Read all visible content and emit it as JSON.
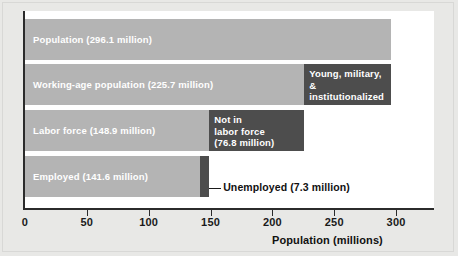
{
  "chart_data": {
    "type": "bar",
    "orientation": "horizontal",
    "title": "",
    "subtitle": "",
    "xlabel": "Population (millions)",
    "ylabel": "",
    "xlim": [
      0,
      325
    ],
    "xticks": [
      0,
      50,
      100,
      150,
      200,
      250,
      300
    ],
    "xtick_labels": [
      "0",
      "50",
      "100",
      "150",
      "200",
      "250",
      "300"
    ],
    "grid": false,
    "legend": false,
    "units": "millions",
    "categories": [
      "Population",
      "Working-age population",
      "Labor force",
      "Employed"
    ],
    "values": [
      296.1,
      225.7,
      148.9,
      141.6
    ],
    "series": [
      {
        "name": "Primary (light gray)",
        "color": "#b4b4b4",
        "values": [
          296.1,
          225.7,
          148.9,
          141.6
        ]
      },
      {
        "name": "Remainder (dark gray)",
        "color": "#4d4d4d",
        "values": [
          null,
          70.4,
          76.8,
          7.3
        ]
      }
    ],
    "bars": [
      {
        "id": "population",
        "label": "Population (296.1 million)",
        "value": 296.1,
        "color": "#b4b4b4",
        "segment": null
      },
      {
        "id": "working-age-population",
        "label": "Working-age population (225.7 million)",
        "value": 225.7,
        "color": "#b4b4b4",
        "segment": {
          "id": "young-military-institutionalized",
          "label": "Young, military,\n& institutionalized\n(70.4 million)",
          "value": 70.4,
          "start": 225.7,
          "end": 296.1,
          "color": "#4d4d4d"
        }
      },
      {
        "id": "labor-force",
        "label": "Labor force (148.9 million)",
        "value": 148.9,
        "color": "#b4b4b4",
        "segment": {
          "id": "not-in-labor-force",
          "label": "Not in\nlabor force\n(76.8 million)",
          "value": 76.8,
          "start": 148.9,
          "end": 225.7,
          "color": "#4d4d4d"
        }
      },
      {
        "id": "employed",
        "label": "Employed (141.6 million)",
        "value": 141.6,
        "color": "#b4b4b4",
        "segment": {
          "id": "unemployed",
          "label": "Unemployed (7.3 million)",
          "value": 7.3,
          "start": 141.6,
          "end": 148.9,
          "color": "#4d4d4d",
          "callout": true
        }
      }
    ],
    "annotations": [
      {
        "id": "unemployed-callout",
        "text": "Unemployed (7.3 million)",
        "points_to": "unemployed"
      }
    ],
    "colors": {
      "light_gray": "#b4b4b4",
      "dark_gray": "#4d4d4d",
      "axis": "#2b2b2b",
      "panel": "#ffffff",
      "background": "#e8e8e6",
      "label_on_bar": "#ffffff",
      "axis_text": "#1a1a1a"
    }
  }
}
